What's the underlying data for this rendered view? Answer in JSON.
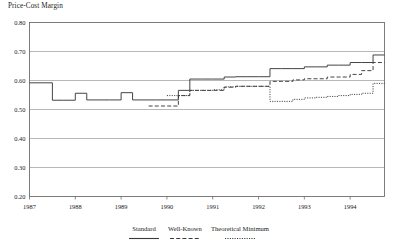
{
  "figure": {
    "title": "Price-Cost Margin"
  },
  "legend": {
    "position": "bottom-center",
    "items": [
      {
        "label": "Standard",
        "style": "solid",
        "key": "standard"
      },
      {
        "label": "Well-Known",
        "style": "dashed",
        "key": "well_known"
      },
      {
        "label": "Theoretical Minimum",
        "style": "dotted",
        "key": "theoretical_minimum"
      }
    ]
  },
  "chart_data": {
    "type": "line",
    "title": "Price-Cost Margin",
    "xlabel": "",
    "ylabel": "Price-Cost Margin",
    "xlim": [
      1987.0,
      1994.75
    ],
    "ylim": [
      0.2,
      0.8
    ],
    "yticks": [
      "0.80",
      "0.70",
      "0.60",
      "0.50",
      "0.40",
      "0.30",
      "0.20"
    ],
    "ytick_values": [
      0.8,
      0.7,
      0.6,
      0.5,
      0.4,
      0.3,
      0.2
    ],
    "xticks": [
      "1987",
      "1988",
      "1989",
      "1990",
      "1991",
      "1992",
      "1993",
      "1994"
    ],
    "xtick_values": [
      1987,
      1988,
      1989,
      1990,
      1991,
      1992,
      1993,
      1994
    ],
    "grid": "horizontal",
    "grid_color": "#9a9a9a",
    "line_color": "#3a3a3a",
    "step_interpolation": "post",
    "series": [
      {
        "name": "Standard",
        "style": "solid",
        "x": [
          1987.0,
          1987.25,
          1987.5,
          1987.75,
          1988.0,
          1988.25,
          1988.5,
          1988.75,
          1989.0,
          1989.25,
          1989.5,
          1989.75,
          1990.0,
          1990.25,
          1990.5,
          1990.75,
          1991.0,
          1991.25,
          1991.5,
          1991.75,
          1992.0,
          1992.25,
          1992.5,
          1992.75,
          1993.0,
          1993.25,
          1993.5,
          1993.75,
          1994.0,
          1994.25,
          1994.5,
          1994.75
        ],
        "values": [
          0.592,
          0.592,
          0.532,
          0.532,
          0.556,
          0.533,
          0.533,
          0.533,
          0.558,
          0.533,
          0.533,
          0.533,
          0.533,
          0.566,
          0.605,
          0.605,
          0.605,
          0.612,
          0.613,
          0.613,
          0.613,
          0.641,
          0.641,
          0.641,
          0.647,
          0.647,
          0.653,
          0.653,
          0.662,
          0.662,
          0.688,
          0.688
        ]
      },
      {
        "name": "Well-Known",
        "style": "dashed",
        "x": [
          1989.6,
          1989.8,
          1990.0,
          1990.25,
          1990.5,
          1990.75,
          1991.0,
          1991.25,
          1991.5,
          1991.75,
          1992.0,
          1992.25,
          1992.5,
          1992.75,
          1993.0,
          1993.25,
          1993.5,
          1993.75,
          1994.0,
          1994.25,
          1994.5,
          1994.75
        ],
        "values": [
          0.512,
          0.512,
          0.512,
          0.548,
          0.566,
          0.566,
          0.566,
          0.577,
          0.58,
          0.58,
          0.58,
          0.597,
          0.597,
          0.602,
          0.606,
          0.606,
          0.612,
          0.612,
          0.621,
          0.634,
          0.662,
          0.662
        ]
      },
      {
        "name": "Theoretical Minimum",
        "style": "dotted",
        "x": [
          1990.0,
          1990.25,
          1990.5,
          1990.75,
          1991.0,
          1991.25,
          1991.5,
          1991.75,
          1992.0,
          1992.25,
          1992.5,
          1992.75,
          1993.0,
          1993.25,
          1993.5,
          1993.75,
          1994.0,
          1994.25,
          1994.5,
          1994.75
        ],
        "values": [
          0.548,
          0.548,
          0.566,
          0.566,
          0.568,
          0.578,
          0.58,
          0.58,
          0.58,
          0.528,
          0.528,
          0.535,
          0.54,
          0.542,
          0.545,
          0.548,
          0.552,
          0.556,
          0.59,
          0.59
        ]
      }
    ]
  }
}
